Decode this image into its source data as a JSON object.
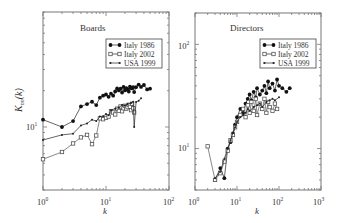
{
  "chart_data": [
    {
      "type": "line",
      "title": "Boards",
      "xlabel": "k",
      "ylabel": "K_nn(k)",
      "xscale": "log",
      "yscale": "log",
      "xlim": [
        1,
        100
      ],
      "ylim": [
        3,
        90
      ],
      "x_ticks": [
        "10^0",
        "10^1",
        "10^2"
      ],
      "y_ticks": [
        "10^1"
      ],
      "grid": false,
      "legend_position": "upper right",
      "series": [
        {
          "name": "Italy 1986",
          "marker": "filled-circle",
          "x": [
            1,
            2,
            3,
            4,
            5,
            6,
            7,
            8,
            9,
            10,
            11,
            12,
            13,
            14,
            15,
            16,
            17,
            18,
            19,
            20,
            21,
            22,
            23,
            24,
            25,
            26,
            27,
            28,
            30,
            33,
            36,
            40,
            45,
            50
          ],
          "y": [
            11.5,
            10,
            11.2,
            14.8,
            15.5,
            16.2,
            15.2,
            17.5,
            18.2,
            18.6,
            17.8,
            18.9,
            18.2,
            19.7,
            20.9,
            20.1,
            20.8,
            19.3,
            21.5,
            20.1,
            21,
            20.5,
            19.7,
            21.6,
            21,
            20.9,
            21.4,
            19.5,
            21.4,
            22.5,
            21.5,
            22.3,
            20.5,
            20.8
          ]
        },
        {
          "name": "Italy 2002",
          "marker": "open-square",
          "x": [
            1,
            2,
            3,
            4,
            5,
            6,
            7,
            8,
            9,
            10,
            11,
            12,
            13,
            14,
            15,
            16,
            17,
            18,
            19,
            20,
            21,
            22,
            23,
            24,
            25,
            26,
            27,
            28
          ],
          "y": [
            5.4,
            6.2,
            7.3,
            8.2,
            8.6,
            7.2,
            8.5,
            11.8,
            11.6,
            11.9,
            12.2,
            13.5,
            13.2,
            12.7,
            14.2,
            13.6,
            14.8,
            13.5,
            14.3,
            15,
            14.2,
            14.6,
            15.3,
            14.7,
            13.8,
            15.6,
            14.3,
            13.2
          ]
        },
        {
          "name": "USA 1999",
          "marker": "small-dot",
          "x": [
            1,
            2,
            3,
            4,
            5,
            6,
            7,
            8,
            9,
            10,
            11,
            12,
            14,
            16,
            18,
            20,
            22,
            25,
            27,
            28,
            30,
            33,
            36
          ],
          "y": [
            7.8,
            8.6,
            8.8,
            10.3,
            10.7,
            11.5,
            11.2,
            12.2,
            12.3,
            12.8,
            12.5,
            13.8,
            14.2,
            14.5,
            15.2,
            15.1,
            15.5,
            15.8,
            16.2,
            10,
            16.1,
            16.5,
            17.3
          ]
        }
      ]
    },
    {
      "type": "line",
      "title": "Directors",
      "xlabel": "k",
      "ylabel": "",
      "xscale": "log",
      "yscale": "log",
      "xlim": [
        1,
        1000
      ],
      "ylim": [
        4,
        200
      ],
      "x_ticks": [
        "10^0",
        "10^1",
        "10^2",
        "10^3"
      ],
      "y_ticks": [
        "10^1",
        "10^2"
      ],
      "grid": false,
      "legend_position": "upper right",
      "series": [
        {
          "name": "Italy 1986",
          "marker": "filled-circle",
          "x": [
            3,
            4,
            5,
            6,
            7,
            8,
            9,
            10,
            12,
            14,
            16,
            18,
            20,
            22,
            25,
            28,
            30,
            35,
            40,
            45,
            50,
            55,
            60,
            70,
            80,
            90,
            100,
            120,
            150,
            180
          ],
          "y": [
            5,
            6.5,
            5.2,
            10,
            11.5,
            14,
            17,
            20,
            24,
            22,
            27,
            30,
            33,
            29,
            35,
            31,
            38,
            33,
            36,
            40,
            34,
            44,
            38,
            42,
            36,
            46,
            40,
            38,
            35,
            38
          ]
        },
        {
          "name": "Italy 2002",
          "marker": "open-square",
          "x": [
            2,
            3,
            4,
            5,
            6,
            7,
            8,
            9,
            10,
            12,
            14,
            16,
            18,
            20,
            22,
            25,
            28,
            30,
            35,
            40,
            45,
            50,
            55,
            60,
            70,
            80,
            90
          ],
          "y": [
            10.5,
            5,
            5.8,
            7.5,
            9.5,
            12,
            13.5,
            16,
            18,
            21,
            24,
            20,
            26,
            22,
            28,
            23,
            30,
            21,
            27,
            24,
            30,
            22,
            28,
            25,
            23,
            27,
            24
          ]
        },
        {
          "name": "USA 1999",
          "marker": "small-dot",
          "x": [
            3,
            4,
            5,
            6,
            7,
            8,
            9,
            10,
            12,
            14,
            16,
            18,
            20,
            25,
            30,
            35,
            40,
            50,
            60,
            70,
            80,
            100
          ],
          "y": [
            5.2,
            6,
            8,
            10,
            12,
            14,
            16,
            18,
            20,
            21,
            22,
            24,
            23,
            25,
            26,
            27,
            25,
            28,
            29,
            30,
            29,
            31
          ]
        }
      ]
    }
  ],
  "panels": [
    {
      "title": "Boards",
      "xlabel": "k",
      "ylabel_main": "K",
      "ylabel_sub": "nn",
      "ylabel_arg": "(k)",
      "x_tick_labels": [
        {
          "base": "10",
          "exp": "0"
        },
        {
          "base": "10",
          "exp": "1"
        },
        {
          "base": "10",
          "exp": "2"
        }
      ],
      "y_tick_labels": [
        {
          "base": "10",
          "exp": "1"
        }
      ],
      "legend": [
        "Italy 1986",
        "Italy 2002",
        "USA 1999"
      ]
    },
    {
      "title": "Directors",
      "xlabel": "k",
      "x_tick_labels": [
        {
          "base": "10",
          "exp": "0"
        },
        {
          "base": "10",
          "exp": "1"
        },
        {
          "base": "10",
          "exp": "2"
        },
        {
          "base": "10",
          "exp": "3"
        }
      ],
      "y_tick_labels": [
        {
          "base": "10",
          "exp": "1"
        },
        {
          "base": "10",
          "exp": "2"
        }
      ],
      "legend": [
        "Italy 1986",
        "Italy 2002",
        "USA 1999"
      ]
    }
  ],
  "colors": {
    "series": "#111111",
    "square_series": "#555555",
    "axes": "#777777",
    "text": "#333333"
  }
}
